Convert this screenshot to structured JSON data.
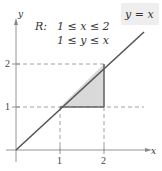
{
  "figure": {
    "region_label": "R:",
    "constraints": [
      "1 ≤ x ≤ 2",
      "1 ≤ y ≤ x"
    ],
    "line_label": "y = x",
    "axes": {
      "x_label": "x",
      "y_label": "y",
      "x_ticks": [
        "1",
        "2"
      ],
      "y_ticks": [
        "1",
        "2"
      ]
    },
    "colors": {
      "axis": "#888888",
      "line": "#555555",
      "region_fill": "#d9d9d9",
      "region_edge": "#666666",
      "dashed": "#888888",
      "label_box": "#eeeeee"
    }
  }
}
